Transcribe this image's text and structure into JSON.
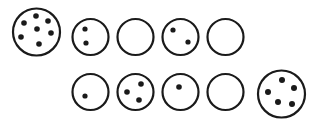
{
  "figure": {
    "title": "",
    "background_color": "#ffffff",
    "stroke_color": "#1a1a1a",
    "dot_color": "#1a1a1a",
    "width": 323,
    "height": 126
  },
  "chart_data": {
    "type": "scatter",
    "title": "",
    "subtitle": "",
    "xlabel": "",
    "ylabel": "",
    "grid": false,
    "legend": null,
    "categories": [
      "top-1",
      "top-2",
      "top-3",
      "top-4",
      "top-5",
      "bottom-1",
      "bottom-2",
      "bottom-3",
      "bottom-4",
      "bottom-5"
    ],
    "values": [
      7,
      2,
      0,
      2,
      1,
      3,
      1,
      0,
      5,
      0
    ],
    "rows": [
      {
        "row": "top",
        "circles": [
          {
            "index": 1,
            "label": "top-1",
            "dot_count": 7,
            "cx": 36.5,
            "cy": 32,
            "r": 23.5,
            "stroke_width": 2.2,
            "dot_r": 2.8,
            "dots": [
              {
                "x": 36,
                "y": 16
              },
              {
                "x": 48,
                "y": 21
              },
              {
                "x": 24,
                "y": 23
              },
              {
                "x": 37,
                "y": 29
              },
              {
                "x": 51,
                "y": 33
              },
              {
                "x": 21,
                "y": 37
              },
              {
                "x": 39,
                "y": 44
              }
            ]
          },
          {
            "index": 2,
            "label": "top-2",
            "dot_count": 2,
            "cx": 90.5,
            "cy": 37,
            "r": 18,
            "stroke_width": 2.2,
            "dot_r": 2.6,
            "dots": [
              {
                "x": 85,
                "y": 29
              },
              {
                "x": 86,
                "y": 43
              }
            ]
          },
          {
            "index": 3,
            "label": "top-3",
            "dot_count": 0,
            "cx": 135.5,
            "cy": 37,
            "r": 18,
            "stroke_width": 2.2,
            "dot_r": 2.6,
            "dots": []
          },
          {
            "index": 4,
            "label": "top-4",
            "dot_count": 2,
            "cx": 180.5,
            "cy": 37,
            "r": 18,
            "stroke_width": 2.2,
            "dot_r": 2.6,
            "dots": [
              {
                "x": 173,
                "y": 30
              },
              {
                "x": 188,
                "y": 42
              }
            ]
          },
          {
            "index": 5,
            "label": "top-5",
            "dot_count": 0,
            "cx": 225.5,
            "cy": 37,
            "r": 18,
            "stroke_width": 2.2,
            "dot_r": 2.6,
            "dots": []
          }
        ]
      },
      {
        "row": "bottom",
        "circles": [
          {
            "index": 6,
            "label": "bottom-1",
            "dot_count": 1,
            "cx": 90.5,
            "cy": 92,
            "r": 18,
            "stroke_width": 2.2,
            "dot_r": 2.6,
            "dots": [
              {
                "x": 85,
                "y": 96
              }
            ]
          },
          {
            "index": 7,
            "label": "bottom-2",
            "dot_count": 3,
            "cx": 135.5,
            "cy": 92,
            "r": 18,
            "stroke_width": 2.2,
            "dot_r": 2.8,
            "dots": [
              {
                "x": 141,
                "y": 84
              },
              {
                "x": 127,
                "y": 92
              },
              {
                "x": 139,
                "y": 100
              }
            ]
          },
          {
            "index": 8,
            "label": "bottom-3",
            "dot_count": 1,
            "cx": 180.5,
            "cy": 92,
            "r": 18,
            "stroke_width": 2.2,
            "dot_r": 2.8,
            "dots": [
              {
                "x": 179,
                "y": 87
              }
            ]
          },
          {
            "index": 9,
            "label": "bottom-4",
            "dot_count": 0,
            "cx": 225.5,
            "cy": 92,
            "r": 18,
            "stroke_width": 2.2,
            "dot_r": 2.6,
            "dots": []
          },
          {
            "index": 10,
            "label": "bottom-5",
            "dot_count": 5,
            "cx": 281.5,
            "cy": 94,
            "r": 23.5,
            "stroke_width": 2.2,
            "dot_r": 3.0,
            "dots": [
              {
                "x": 282,
                "y": 80
              },
              {
                "x": 294,
                "y": 88
              },
              {
                "x": 268,
                "y": 92
              },
              {
                "x": 278,
                "y": 102
              },
              {
                "x": 292,
                "y": 104
              }
            ]
          }
        ]
      }
    ]
  }
}
